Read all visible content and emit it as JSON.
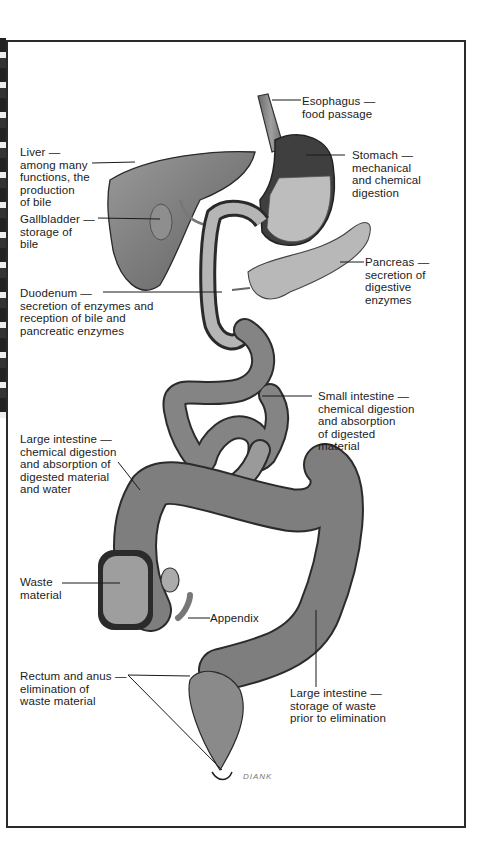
{
  "diagram": {
    "colors": {
      "organ_fill": "#7a7a7a",
      "organ_dark": "#3c3c3c",
      "highlight": "#c9c9c9",
      "frame": "#2a2a2a",
      "text": "#1c1c1c"
    },
    "labels": {
      "esophagus": {
        "name": "Esophagus —",
        "desc": "food passage"
      },
      "liver": {
        "name": "Liver —",
        "desc": "among many\nfunctions, the\nproduction\nof bile"
      },
      "stomach": {
        "name": "Stomach —",
        "desc": "mechanical\nand chemical\ndigestion"
      },
      "gallbladder": {
        "name": "Gallbladder —",
        "desc": "storage of\nbile"
      },
      "pancreas": {
        "name": "Pancreas —",
        "desc": "secretion of\ndigestive\nenzymes"
      },
      "duodenum": {
        "name": "Duodenum —",
        "desc": "secretion of enzymes and\nreception of bile and\npancreatic enzymes"
      },
      "small_intestine": {
        "name": "Small intestine —",
        "desc": "chemical digestion\nand absorption\nof digested\nmaterial"
      },
      "large_intestine_upper": {
        "name": "Large intestine —",
        "desc": "chemical digestion\nand absorption of\ndigested material\nand water"
      },
      "waste": {
        "name": "Waste",
        "desc": "material"
      },
      "appendix": {
        "name": "Appendix",
        "desc": ""
      },
      "rectum": {
        "name": "Rectum and anus —",
        "desc": "elimination of\nwaste material"
      },
      "large_intestine_lower": {
        "name": "Large intestine —",
        "desc": "storage of waste\nprior to elimination"
      }
    },
    "signature": "DIANK"
  }
}
